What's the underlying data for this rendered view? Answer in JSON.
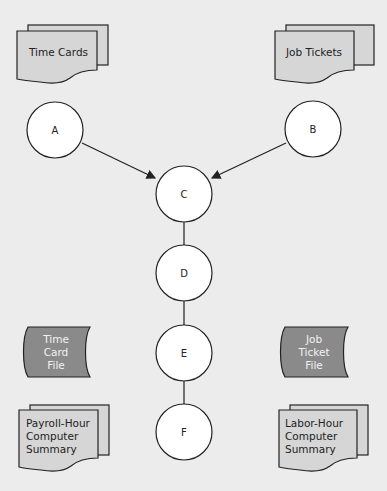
{
  "diagram": {
    "documents": [
      {
        "id": "time-cards",
        "lines": [
          "Time Cards"
        ]
      },
      {
        "id": "job-tickets",
        "lines": [
          "Job Tickets"
        ]
      },
      {
        "id": "payroll-summary",
        "lines": [
          "Payroll-Hour",
          "Computer",
          "Summary"
        ]
      },
      {
        "id": "labor-summary",
        "lines": [
          "Labor-Hour",
          "Computer",
          "Summary"
        ]
      }
    ],
    "files": [
      {
        "id": "time-card-file",
        "lines": [
          "Time",
          "Card",
          "File"
        ]
      },
      {
        "id": "job-ticket-file",
        "lines": [
          "Job",
          "Ticket",
          "File"
        ]
      }
    ],
    "nodes": [
      {
        "id": "A",
        "label": "A"
      },
      {
        "id": "B",
        "label": "B"
      },
      {
        "id": "C",
        "label": "C"
      },
      {
        "id": "D",
        "label": "D"
      },
      {
        "id": "E",
        "label": "E"
      },
      {
        "id": "F",
        "label": "F"
      }
    ],
    "edges": [
      {
        "from": "A",
        "to": "C",
        "arrow": true
      },
      {
        "from": "B",
        "to": "C",
        "arrow": true
      },
      {
        "from": "C",
        "to": "D",
        "arrow": false
      },
      {
        "from": "D",
        "to": "E",
        "arrow": false
      },
      {
        "from": "E",
        "to": "F",
        "arrow": false
      }
    ],
    "colors": {
      "document_fill": "#d6d6d6",
      "file_fill": "#8a8a8a",
      "node_fill": "#ffffff",
      "stroke": "#222222",
      "background": "#ececec"
    }
  }
}
